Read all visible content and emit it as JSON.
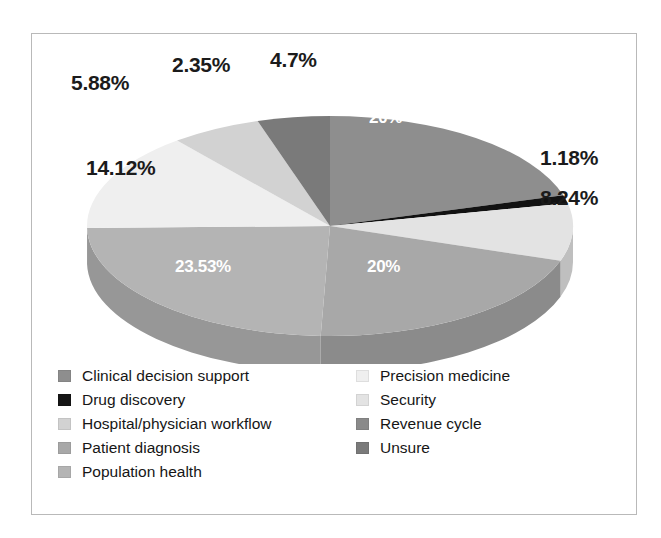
{
  "chart_data": {
    "type": "pie",
    "title": "",
    "subtitle": "",
    "xlabel": "",
    "ylabel": "",
    "grid": false,
    "legend_position": "bottom",
    "legend_columns": 2,
    "three_d": true,
    "start_angle_deg": 0,
    "direction": "clockwise",
    "value_unit": "percent",
    "categories": [
      "Clinical decision support",
      "Drug discovery",
      "Security",
      "Patient diagnosis",
      "Population health",
      "Precision medicine",
      "Hospital/physician workflow",
      "Unsure"
    ],
    "values": [
      20,
      1.18,
      8.24,
      20,
      23.53,
      14.12,
      5.88,
      4.7
    ],
    "labels": [
      "20%",
      "1.18%",
      "8.24%",
      "20%",
      "23.53%",
      "14.12%",
      "5.88%",
      "2.35%",
      "4.7%"
    ],
    "slices": [
      {
        "name": "Clinical decision support",
        "value": 20,
        "label": "20%",
        "color": "#8e8e8e",
        "side_color": "#6f6f6f",
        "label_inside": true
      },
      {
        "name": "Drug discovery",
        "value": 1.18,
        "label": "1.18%",
        "color": "#121212",
        "side_color": "#050505",
        "label_inside": false
      },
      {
        "name": "Security",
        "value": 8.24,
        "label": "8.24%",
        "color": "#e3e3e3",
        "side_color": "#bfbfbf",
        "label_inside": false
      },
      {
        "name": "Patient diagnosis",
        "value": 20,
        "label": "20%",
        "color": "#a8a8a8",
        "side_color": "#8b8b8b",
        "label_inside": true
      },
      {
        "name": "Population health",
        "value": 23.53,
        "label": "23.53%",
        "color": "#b4b4b4",
        "side_color": "#979797",
        "label_inside": true
      },
      {
        "name": "Precision medicine",
        "value": 14.12,
        "label": "14.12%",
        "color": "#efefef",
        "side_color": "#cbcbcb",
        "label_inside": false
      },
      {
        "name": "Hospital/physician workflow",
        "value": 5.88,
        "label": "5.88%",
        "color": "#d2d2d2",
        "side_color": "#b0b0b0",
        "label_inside": false
      },
      {
        "name": "Unsure",
        "value": 4.7,
        "label": "4.7%",
        "color": "#7a7a7a",
        "side_color": "#5e5e5e",
        "label_inside": false
      }
    ],
    "extra_label": {
      "text": "2.35%",
      "note": "unlabelled small wedge callout"
    }
  },
  "pie_labels": {
    "clinical_decision_support": "20%",
    "drug_discovery": "1.18%",
    "security": "8.24%",
    "patient_diagnosis": "20%",
    "population_health": "23.53%",
    "precision_medicine": "14.12%",
    "hospital_workflow": "5.88%",
    "small_wedge": "2.35%",
    "unsure": "4.7%"
  },
  "legend": {
    "left_column": [
      {
        "label": "Clinical decision support",
        "color": "#8e8e8e"
      },
      {
        "label": "Drug discovery",
        "color": "#151515"
      },
      {
        "label": "Hospital/physician workflow",
        "color": "#d2d2d2"
      },
      {
        "label": "Patient diagnosis",
        "color": "#a8a8a8"
      },
      {
        "label": "Population health",
        "color": "#b4b4b4"
      }
    ],
    "right_column": [
      {
        "label": "Precision medicine",
        "color": "#efefef"
      },
      {
        "label": "Security",
        "color": "#e3e3e3"
      },
      {
        "label": "Revenue cycle",
        "color": "#8a8a8a"
      },
      {
        "label": "Unsure",
        "color": "#7a7a7a"
      }
    ]
  },
  "colors": {
    "background": "#ffffff",
    "frame_border": "#b9b9b9",
    "label_text": "#1b1b1b",
    "inside_label_text": "#ffffff"
  }
}
